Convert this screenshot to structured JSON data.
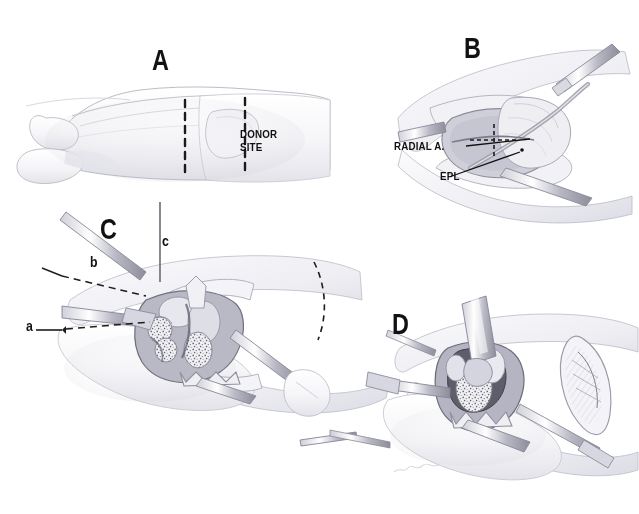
{
  "figure": {
    "background_color": "#ffffff",
    "ink_color": "#4a4a52",
    "label_color": "#121212",
    "width": 639,
    "height": 514
  },
  "panels": [
    {
      "id": "A",
      "letter": "A",
      "caption": "Hand and wrist, dorsoradial view with donor site marked between dashed lines",
      "labels": [
        {
          "name": "donor-site",
          "text": "DONOR\nSITE"
        }
      ],
      "markers": []
    },
    {
      "id": "B",
      "letter": "B",
      "caption": "Surgical exposure of the dorsal wrist showing radial artery and extensor pollicis longus",
      "labels": [
        {
          "name": "radial-artery",
          "text": "RADIAL A."
        },
        {
          "name": "epl",
          "text": "EPL"
        }
      ],
      "markers": []
    },
    {
      "id": "C",
      "letter": "C",
      "caption": "Retractors in place, cortical window opened and cancellous bone graft exposed",
      "labels": [],
      "markers": [
        {
          "name": "marker-a",
          "text": "a"
        },
        {
          "name": "marker-b",
          "text": "b"
        },
        {
          "name": "marker-c",
          "text": "c"
        }
      ]
    },
    {
      "id": "D",
      "letter": "D",
      "caption": "Graft harvest with curette and instruments; inset shows closed elliptical incision",
      "labels": [],
      "markers": []
    }
  ],
  "artist_signature": "Wanda",
  "colors": {
    "paper": "#ffffff",
    "pencil_dark": "#3f3f46",
    "pencil_mid": "#8b8b94",
    "pencil_light": "#c9c9d1",
    "wash": "#e9e9ee",
    "label_black": "#121212"
  }
}
